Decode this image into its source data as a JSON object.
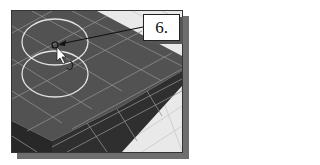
{
  "figure": {
    "callout": {
      "label": "6."
    },
    "colors": {
      "block_top": "#4f4f4f",
      "block_side": "#2e2e2e",
      "grid_line": "#9a9a9a",
      "circle": "#e6e6e6",
      "background_plane": "#e8e8e8",
      "shadow": "#6e6e6e"
    }
  }
}
